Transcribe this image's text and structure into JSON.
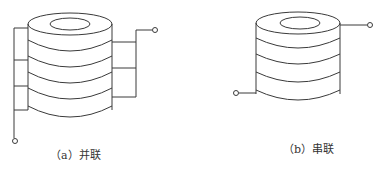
{
  "diagram": {
    "stroke_color": "#3a3a3a",
    "background": "#ffffff",
    "figures": [
      {
        "id": "a",
        "caption": "（a）并联",
        "connection": "parallel",
        "disc_count": 5,
        "terminals": 2
      },
      {
        "id": "b",
        "caption": "（b）串联",
        "connection": "series",
        "disc_count": 4,
        "terminals": 2
      }
    ]
  }
}
